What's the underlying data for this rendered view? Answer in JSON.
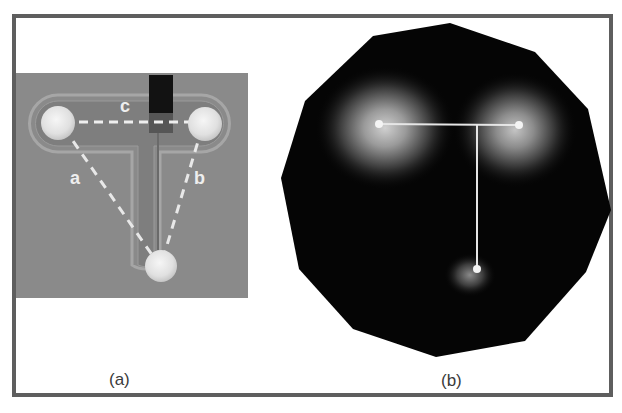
{
  "figure": {
    "panels": [
      {
        "id": "a",
        "caption": "(a)",
        "description": "Sensor board photo with three circular electrodes on a T-shaped trace",
        "edge_labels": [
          "a",
          "b",
          "c"
        ],
        "colors": {
          "board": "#8a8a8a",
          "electrode": "#e8e8e8",
          "dashed_line": "#efefef",
          "chip": "#111111"
        }
      },
      {
        "id": "b",
        "caption": "(b)",
        "description": "Dark polygon heatmap with three glowing points connected by a T-shaped line",
        "colors": {
          "background": "#050505",
          "glow": "#bdbdbd",
          "line": "#e6e6e6"
        }
      }
    ],
    "frame_color": "#5e5e5e"
  }
}
